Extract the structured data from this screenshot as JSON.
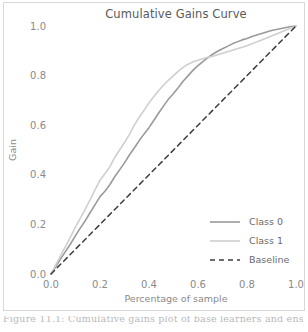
{
  "figure": {
    "caption_partial": "Figure 11.1: Cumulative gains plot of base learners and ensemble. The ...",
    "border_color": "#d8d8d8",
    "background": "#ffffff"
  },
  "chart_data": {
    "type": "line",
    "title": "Cumulative Gains Curve",
    "xlabel": "Percentage of sample",
    "ylabel": "Gain",
    "xlim": [
      0.0,
      1.0
    ],
    "ylim": [
      0.0,
      1.0
    ],
    "grid": false,
    "legend_position": "lower-right",
    "xticks": [
      0.0,
      0.2,
      0.4,
      0.6,
      0.8,
      1.0
    ],
    "xtick_labels": [
      "0.0",
      "0.2",
      "0.4",
      "0.6",
      "0.8",
      "1.0"
    ],
    "yticks": [
      0.0,
      0.2,
      0.4,
      0.6,
      0.8,
      1.0
    ],
    "ytick_labels": [
      "0.0",
      "0.2",
      "0.4",
      "0.6",
      "0.8",
      "1.0"
    ],
    "series": [
      {
        "name": "Class 0",
        "color": "#9a9a9a",
        "width": 1.6,
        "dash": "none",
        "x": [
          0.0,
          0.02,
          0.04,
          0.06,
          0.08,
          0.1,
          0.12,
          0.14,
          0.16,
          0.18,
          0.2,
          0.22,
          0.24,
          0.26,
          0.28,
          0.3,
          0.32,
          0.34,
          0.36,
          0.38,
          0.4,
          0.42,
          0.44,
          0.46,
          0.48,
          0.5,
          0.52,
          0.54,
          0.56,
          0.58,
          0.6,
          0.62,
          0.64,
          0.66,
          0.68,
          0.7,
          0.72,
          0.74,
          0.76,
          0.78,
          0.8,
          0.82,
          0.84,
          0.86,
          0.88,
          0.9,
          0.92,
          0.94,
          0.96,
          0.98,
          1.0
        ],
        "y": [
          0.0,
          0.03,
          0.062,
          0.092,
          0.122,
          0.155,
          0.186,
          0.215,
          0.248,
          0.28,
          0.312,
          0.334,
          0.36,
          0.392,
          0.42,
          0.448,
          0.48,
          0.508,
          0.538,
          0.565,
          0.59,
          0.62,
          0.65,
          0.678,
          0.706,
          0.728,
          0.752,
          0.778,
          0.8,
          0.822,
          0.84,
          0.856,
          0.872,
          0.886,
          0.898,
          0.908,
          0.918,
          0.928,
          0.936,
          0.944,
          0.95,
          0.958,
          0.964,
          0.97,
          0.976,
          0.982,
          0.986,
          0.99,
          0.994,
          0.998,
          1.0
        ]
      },
      {
        "name": "Class 1",
        "color": "#cfcfcf",
        "width": 1.6,
        "dash": "none",
        "x": [
          0.0,
          0.02,
          0.04,
          0.06,
          0.08,
          0.1,
          0.12,
          0.14,
          0.16,
          0.18,
          0.2,
          0.22,
          0.24,
          0.26,
          0.28,
          0.3,
          0.32,
          0.34,
          0.36,
          0.38,
          0.4,
          0.42,
          0.44,
          0.46,
          0.48,
          0.5,
          0.52,
          0.54,
          0.56,
          0.58,
          0.6,
          0.62,
          0.64,
          0.66,
          0.68,
          0.7,
          0.72,
          0.74,
          0.76,
          0.78,
          0.8,
          0.82,
          0.84,
          0.86,
          0.88,
          0.9,
          0.92,
          0.94,
          0.96,
          0.98,
          1.0
        ],
        "y": [
          0.0,
          0.038,
          0.076,
          0.112,
          0.15,
          0.19,
          0.225,
          0.262,
          0.3,
          0.34,
          0.378,
          0.404,
          0.432,
          0.47,
          0.5,
          0.53,
          0.562,
          0.6,
          0.632,
          0.66,
          0.69,
          0.716,
          0.74,
          0.762,
          0.782,
          0.8,
          0.818,
          0.834,
          0.846,
          0.856,
          0.862,
          0.868,
          0.874,
          0.878,
          0.884,
          0.89,
          0.896,
          0.902,
          0.908,
          0.914,
          0.92,
          0.928,
          0.936,
          0.944,
          0.952,
          0.96,
          0.968,
          0.976,
          0.984,
          0.992,
          1.0
        ]
      },
      {
        "name": "Baseline",
        "color": "#3c3c46",
        "width": 1.5,
        "dash": "5,4",
        "x": [
          0.0,
          1.0
        ],
        "y": [
          0.0,
          1.0
        ]
      }
    ]
  },
  "legend": {
    "items": [
      {
        "label": "Class 0",
        "color": "#9a9a9a",
        "dash": "none"
      },
      {
        "label": "Class 1",
        "color": "#cfcfcf",
        "dash": "none"
      },
      {
        "label": "Baseline",
        "color": "#3c3c46",
        "dash": "5,4"
      }
    ]
  }
}
